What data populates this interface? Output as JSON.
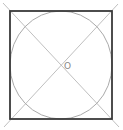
{
  "diagram": {
    "title": "",
    "shapes": {
      "square": {
        "x": 10,
        "y": 11,
        "width": 102,
        "height": 108,
        "stroke": "#333333",
        "stroke_width": 1.8
      },
      "circle": {
        "cx": 61,
        "cy": 65,
        "rx": 51,
        "ry": 54,
        "stroke": "#aaaaaa"
      },
      "diagonals": [
        {
          "from": [
            3,
            3
          ],
          "to": [
            119,
            127
          ],
          "stroke": "#b0b0b0"
        },
        {
          "from": [
            118,
            4
          ],
          "to": [
            4,
            127
          ],
          "stroke": "#b0b0b0"
        }
      ]
    },
    "labels": {
      "center": "O"
    }
  }
}
